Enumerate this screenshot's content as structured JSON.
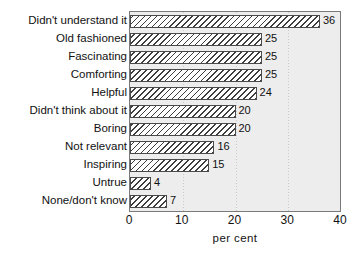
{
  "chart_data": {
    "type": "bar",
    "orientation": "horizontal",
    "title": "",
    "xlabel": "per cent",
    "ylabel": "",
    "xlim": [
      0,
      40
    ],
    "xticks": [
      0,
      10,
      20,
      30,
      40
    ],
    "xtick_labels": [
      "0",
      "10",
      "20",
      "30",
      "40"
    ],
    "grid": true,
    "grid_axis": "x",
    "legend": false,
    "categories": [
      "Didn't understand it",
      "Old fashioned",
      "Fascinating",
      "Comforting",
      "Helpful",
      "Didn't think about it",
      "Boring",
      "Not relevant",
      "Inspiring",
      "Untrue",
      "None/don't know"
    ],
    "values": [
      36,
      25,
      25,
      25,
      24,
      20,
      20,
      16,
      15,
      4,
      7
    ],
    "value_labels": [
      "36",
      "25",
      "25",
      "25",
      "24",
      "20",
      "20",
      "16",
      "15",
      "4",
      "7"
    ],
    "bar_fill": "hatched-diagonal",
    "colors": {
      "plot_background": "#ededed",
      "plot_border": "#7a7a7a",
      "bar_border": "#4a4a4a",
      "bar_hatch": "#3d3d3d",
      "bar_fill": "#ffffff",
      "gridline": "#c9c9c9",
      "text": "#111111",
      "page_background": "#ffffff"
    }
  }
}
